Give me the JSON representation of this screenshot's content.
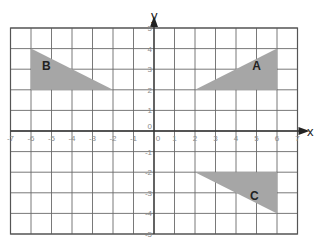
{
  "diagram": {
    "title": "",
    "axes": {
      "x_label": "x",
      "y_label": "y",
      "x_range": [
        -7,
        7
      ],
      "y_range": [
        -5,
        5
      ],
      "x_ticks": [
        "-7",
        "-6",
        "-5",
        "-4",
        "-3",
        "-2",
        "-1",
        "0",
        "1",
        "2",
        "3",
        "4",
        "5",
        "6",
        "7"
      ],
      "y_ticks": [
        "5",
        "4",
        "3",
        "2",
        "1",
        "0",
        "-1",
        "-2",
        "-3",
        "-4",
        "-5"
      ],
      "origin_label": "0"
    },
    "colors": {
      "shape_fill": "#a6a6a6",
      "grid": "#6a6a6a",
      "axis": "#333333"
    },
    "shapes": [
      {
        "label": "A",
        "vertices": [
          [
            2,
            2
          ],
          [
            6,
            2
          ],
          [
            6,
            4
          ]
        ]
      },
      {
        "label": "B",
        "vertices": [
          [
            -6,
            2
          ],
          [
            -6,
            4
          ],
          [
            -2,
            2
          ]
        ]
      },
      {
        "label": "C",
        "vertices": [
          [
            2,
            -2
          ],
          [
            6,
            -2
          ],
          [
            6,
            -4
          ]
        ]
      }
    ]
  }
}
